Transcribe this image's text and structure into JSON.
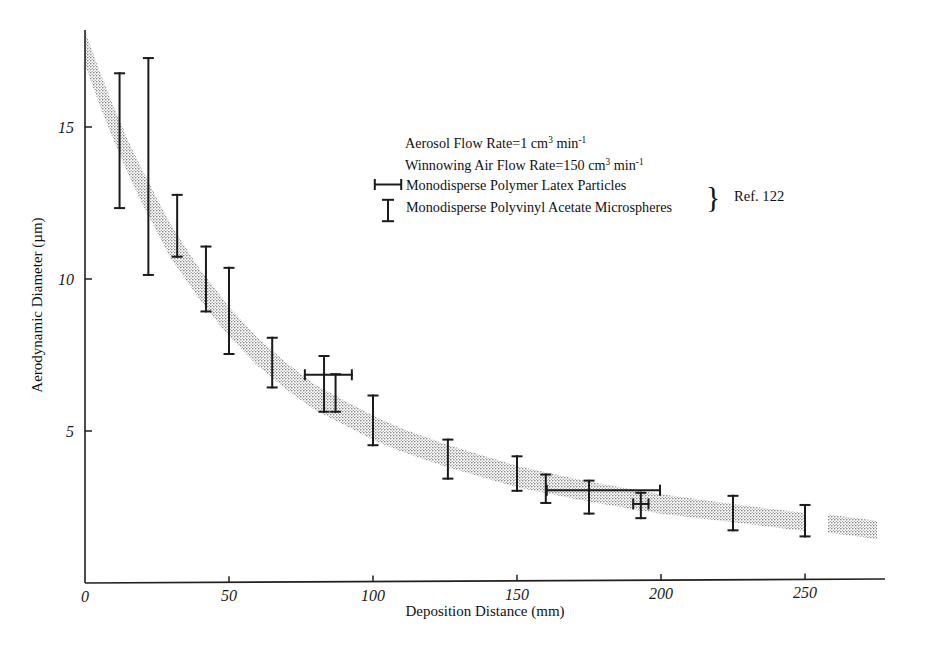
{
  "chart_data": {
    "type": "line",
    "title": "",
    "xlabel": "Deposition Distance (mm)",
    "ylabel": "Aerodynamic Diameter (µm)",
    "xlim": [
      0,
      275
    ],
    "ylim": [
      0,
      18.4
    ],
    "xticks": [
      0,
      50,
      100,
      150,
      200,
      250
    ],
    "xticklabels": [
      "0",
      "50",
      "100",
      "150",
      "200",
      "250"
    ],
    "yticks": [
      5,
      10,
      15
    ],
    "yticklabels": [
      "5",
      "10",
      "15"
    ],
    "grid": false,
    "legend_position": "upper-center",
    "band": {
      "name": "Correlation band (Ref. 122)",
      "color": "#a8a8a8",
      "description": "Stippled grey band decreasing from ~18 um at 0 mm to ~1.6 um at 275 mm, with a break near 258 mm",
      "center_x": [
        0,
        5,
        10,
        15,
        20,
        25,
        30,
        35,
        40,
        45,
        50,
        60,
        70,
        80,
        90,
        100,
        110,
        125,
        150,
        175,
        200,
        225,
        250,
        258,
        275
      ],
      "center_y": [
        17.6,
        16.3,
        15.1,
        14.0,
        13.0,
        12.1,
        11.2,
        10.5,
        9.8,
        9.2,
        8.6,
        7.6,
        6.8,
        6.1,
        5.6,
        5.1,
        4.7,
        4.2,
        3.5,
        3.0,
        2.6,
        2.3,
        2.0,
        1.95,
        1.75
      ],
      "half_width": [
        0.55,
        0.55,
        0.55,
        0.55,
        0.55,
        0.55,
        0.55,
        0.52,
        0.5,
        0.5,
        0.48,
        0.46,
        0.44,
        0.42,
        0.4,
        0.4,
        0.38,
        0.37,
        0.35,
        0.33,
        0.32,
        0.3,
        0.3,
        0.3,
        0.3
      ]
    },
    "series": [
      {
        "name": "Monodisperse Polymer Latex Particles",
        "marker": "horizontal-error-bar",
        "points": [
          {
            "x": 83,
            "y": 6.85,
            "xerr_low": 76,
            "xerr_high": 93
          },
          {
            "x": 175,
            "y": 3.05,
            "xerr_low": 160,
            "xerr_high": 200
          },
          {
            "x": 193,
            "y": 2.6,
            "xerr_low": 190,
            "xerr_high": 196
          }
        ]
      },
      {
        "name": "Monodisperse Polyvinyl Acetate Microspheres",
        "marker": "vertical-error-bar",
        "points": [
          {
            "x": 12,
            "y": 16.3,
            "ylow": 12.3,
            "yhigh": 16.8
          },
          {
            "x": 22,
            "y": 14.0,
            "ylow": 10.1,
            "yhigh": 17.3
          },
          {
            "x": 32,
            "y": 11.6,
            "ylow": 10.7,
            "yhigh": 12.8
          },
          {
            "x": 42,
            "y": 10.2,
            "ylow": 8.9,
            "yhigh": 11.1
          },
          {
            "x": 50,
            "y": 9.3,
            "ylow": 7.5,
            "yhigh": 10.4
          },
          {
            "x": 65,
            "y": 7.4,
            "ylow": 6.4,
            "yhigh": 8.1
          },
          {
            "x": 83,
            "y": 6.85,
            "ylow": 5.6,
            "yhigh": 7.5
          },
          {
            "x": 87,
            "y": 6.3,
            "ylow": 5.6,
            "yhigh": 6.9
          },
          {
            "x": 100,
            "y": 5.55,
            "ylow": 4.5,
            "yhigh": 6.2
          },
          {
            "x": 126,
            "y": 4.2,
            "ylow": 3.4,
            "yhigh": 4.75
          },
          {
            "x": 150,
            "y": 3.6,
            "ylow": 3.0,
            "yhigh": 4.2
          },
          {
            "x": 160,
            "y": 3.1,
            "ylow": 2.6,
            "yhigh": 3.6
          },
          {
            "x": 175,
            "y": 3.05,
            "ylow": 2.25,
            "yhigh": 3.4
          },
          {
            "x": 193,
            "y": 2.6,
            "ylow": 2.1,
            "yhigh": 3.0
          },
          {
            "x": 225,
            "y": 2.3,
            "ylow": 1.7,
            "yhigh": 2.9
          },
          {
            "x": 250,
            "y": 2.0,
            "ylow": 1.5,
            "yhigh": 2.6
          }
        ]
      }
    ],
    "annotations": [
      "Aerosol Flow Rate=1 cm3 min-1",
      "Winnowing Air Flow Rate=150 cm3 min-1"
    ]
  },
  "axes": {
    "x_title": "Deposition Distance (mm)",
    "y_title": "Aerodynamic Diameter (µm)",
    "x_tick_labels": [
      "0",
      "50",
      "100",
      "150",
      "200",
      "250"
    ],
    "y_tick_labels": [
      "5",
      "10",
      "15"
    ]
  },
  "legend": {
    "line1_pre": "Aerosol Flow Rate=1 cm",
    "line1_sup1": "3",
    "line1_mid": " min",
    "line1_sup2": "-1",
    "line2_pre": "Winnowing Air Flow Rate=150 cm",
    "line2_sup1": "3",
    "line2_mid": " min",
    "line2_sup2": "-1",
    "entry1": "Monodisperse Polymer Latex Particles",
    "entry2": "Monodisperse Polyvinyl Acetate Microspheres",
    "brace": "}",
    "reference": "Ref. 122"
  }
}
